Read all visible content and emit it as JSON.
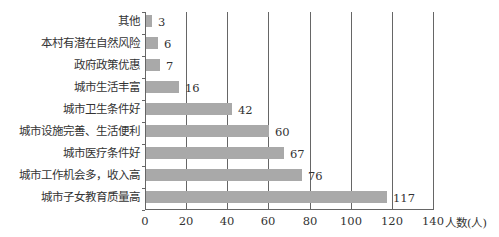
{
  "chart_data": {
    "type": "bar",
    "orientation": "horizontal",
    "title": "",
    "xlabel": "人数(人)",
    "ylabel": "",
    "xlim": [
      0,
      140
    ],
    "x_ticks": [
      "0",
      "20",
      "40",
      "60",
      "80",
      "100",
      "120",
      "140"
    ],
    "grid": "vertical lines at each x tick",
    "legend": "none",
    "bar_color": "#a9a9a9",
    "categories": [
      "其他",
      "本村有潜在自然风险",
      "政府政策优惠",
      "城市生活丰富",
      "城市卫生条件好",
      "城市设施完善、生活便利",
      "城市医疗条件好",
      "城市工作机会多，收入高",
      "城市子女教育质量高"
    ],
    "values": [
      3,
      6,
      7,
      16,
      42,
      60,
      67,
      76,
      117
    ],
    "value_labels": [
      "3",
      "6",
      "7",
      "16",
      "42",
      "60",
      "67",
      "76",
      "117"
    ]
  }
}
